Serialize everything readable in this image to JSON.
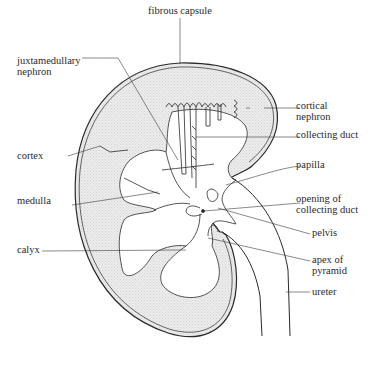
{
  "diagram": {
    "colors": {
      "line": "#2a2a2a",
      "cortex_fill": "#e6e6e6",
      "background": "#ffffff"
    },
    "labels": {
      "fibrous_capsule": "fibrous capsule",
      "juxtamedullary_nephron_1": "juxtamedullary",
      "juxtamedullary_nephron_2": "nephron",
      "cortical_nephron_1": "cortical",
      "cortical_nephron_2": "nephron",
      "collecting_duct": "collecting duct",
      "cortex": "cortex",
      "papilla": "papilla",
      "medulla": "medulla",
      "opening_1": "opening of",
      "opening_2": "collecting duct",
      "pelvis": "pelvis",
      "calyx": "calyx",
      "apex_1": "apex of",
      "apex_2": "pyramid",
      "ureter": "ureter"
    }
  }
}
